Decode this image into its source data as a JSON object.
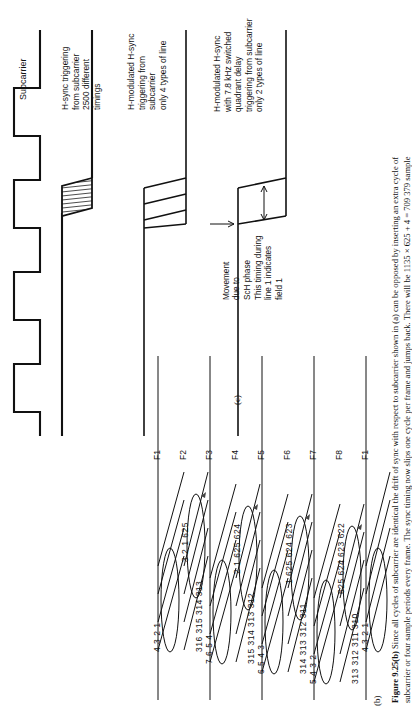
{
  "figure": {
    "caption_lines": [
      "Figure 9.25(b) Since all cycles of subcarrier are identical the drift of sync with respect to subcarrier shown in (a) can be opposed by inserting an extra cycle of",
      "subcarrier or four sample periods every frame. The sync timing now slips one cycle per frame and jumps back. There will be 1135 × 625 + 4 = 709 379 sample"
    ],
    "caption_lead": "Figure 9.25(b)",
    "panel_b_label": "(b)",
    "panel_c_label": "(c)"
  },
  "panel_c": {
    "traces": [
      {
        "id": "subcarrier",
        "label": "Subcarrier",
        "label_lines": [
          "Subcarrier"
        ]
      },
      {
        "id": "hsync-from-subcarrier",
        "label_lines": [
          "H-sync triggering",
          "from subcarrier",
          "2500 different",
          "timings"
        ]
      },
      {
        "id": "h-modulated-4-types",
        "label_lines": [
          "H-modulated H-sync",
          "triggering from",
          "subcarrier",
          "only 4 types of line"
        ]
      },
      {
        "id": "h-modulated-quadrant-delay",
        "label_lines": [
          "H-modulated H-sync",
          "with 7.8 kHz switched",
          "quadrant delay",
          "triggering from subcarrier",
          "only 2 types of line"
        ]
      }
    ],
    "annotations": [
      {
        "id": "movement-sch",
        "lines": [
          "Movement",
          "due to",
          "ScH phase"
        ]
      },
      {
        "id": "timing-line1-field1",
        "lines": [
          "This timing during",
          "line 1 indicates",
          "field 1"
        ]
      }
    ]
  },
  "panel_b": {
    "fields": [
      {
        "name": "F1",
        "upper_numbers": [
          "4",
          "3",
          "2",
          "1"
        ],
        "lower_numbers": []
      },
      {
        "name": "F2",
        "upper_numbers": [
          "3",
          "2",
          "1"
        ],
        "lower_numbers": [
          "316",
          "315",
          "314",
          "313"
        ],
        "edge_number": "625"
      },
      {
        "name": "F3",
        "upper_numbers": [
          "7",
          "6",
          "5",
          "4"
        ],
        "lower_numbers": []
      },
      {
        "name": "F4",
        "upper_numbers": [
          "2",
          "1"
        ],
        "lower_numbers": [
          "315",
          "314",
          "313",
          "312"
        ],
        "edge_number": "625"
      },
      {
        "name": "F5",
        "upper_numbers": [
          "6",
          "5",
          "4",
          "3"
        ],
        "lower_numbers": [],
        "edge_number": "624"
      },
      {
        "name": "F6",
        "upper_numbers": [
          "1"
        ],
        "lower_numbers": [
          "314",
          "313",
          "312",
          "311"
        ],
        "edge_number": "625 624"
      },
      {
        "name": "F7",
        "upper_numbers": [
          "5",
          "4",
          "3",
          "2"
        ],
        "lower_numbers": [],
        "edge_number": "623"
      },
      {
        "name": "F8",
        "upper_numbers": [],
        "lower_numbers": [
          "313",
          "312",
          "311",
          "310"
        ],
        "edge_number": "625 624 623 622"
      },
      {
        "name": "F1",
        "upper_numbers": [
          "4",
          "3",
          "2",
          "1"
        ],
        "lower_numbers": []
      }
    ],
    "group_f1": {
      "row_top": "4    3    2    1",
      "field": "F1"
    },
    "group_f2": {
      "field": "F2",
      "row_top": "3    2    1    625",
      "row_bottom": "316  315  314  313"
    },
    "group_f3": {
      "field": "F3",
      "row_top": "7    6    5    4"
    },
    "group_f4": {
      "field": "F4",
      "row_top": "2    1    625  624",
      "row_bottom": "315  314  313  312"
    },
    "group_f5": {
      "field": "F5",
      "row_top": "6    5    4    3"
    },
    "group_f6": {
      "field": "F6",
      "row_top": "1    625  624  623",
      "row_bottom": "314  313  312  311"
    },
    "group_f7": {
      "field": "F7",
      "row_top": "5    4    3    2"
    },
    "group_f8": {
      "field": "F8",
      "row_top": "625  624  623  622",
      "row_bottom": "313  312  311  310"
    },
    "group_f1b": {
      "field": "F1",
      "row_top": "4    3    2    1"
    }
  }
}
